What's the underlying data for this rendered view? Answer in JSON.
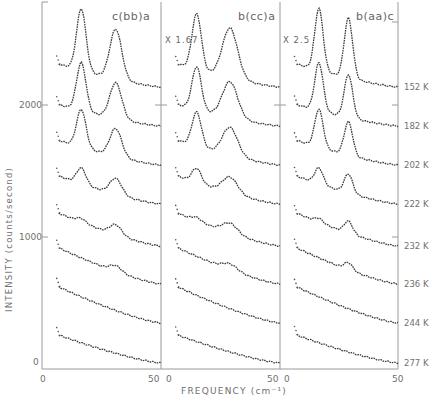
{
  "chart_data": {
    "type": "line",
    "ylabel": "INTENSITY (counts/second)",
    "xlabel": "FREQUENCY (cm⁻¹)",
    "y_ticks": [
      "0",
      "1000",
      "2000"
    ],
    "x_ticks": [
      "0",
      "50"
    ],
    "xlim": [
      0,
      50
    ],
    "panels": [
      {
        "title": "c(bb)a",
        "scale": "",
        "peaks_cm1": [
          17,
          30
        ]
      },
      {
        "title": "b(cc)a",
        "scale": "X 1.67",
        "peaks_cm1": [
          15,
          28
        ]
      },
      {
        "title": "b(aa)c",
        "scale": "X 2.5",
        "peaks_cm1": [
          17,
          28
        ]
      }
    ],
    "temperatures": [
      "152 K",
      "182 K",
      "202 K",
      "222 K",
      "232 K",
      "236 K",
      "244 K",
      "277 K"
    ],
    "grid": false,
    "legend": "none"
  },
  "labels": {
    "ylabel": "INTENSITY (counts/second)",
    "xlabel": "FREQUENCY (cm⁻¹)",
    "y2000": "2000",
    "y1000": "1000",
    "y0": "0",
    "x0": "0",
    "x50": "50",
    "panel1_title": "c(bb)a",
    "panel2_title": "b(cc)a",
    "panel3_title": "b(aa)c",
    "panel2_scale": "X 1.67",
    "panel3_scale": "X 2.5",
    "t0": "152 K",
    "t1": "182 K",
    "t2": "202 K",
    "t3": "222 K",
    "t4": "232 K",
    "t5": "236 K",
    "t6": "244 K",
    "t7": "277 K"
  }
}
